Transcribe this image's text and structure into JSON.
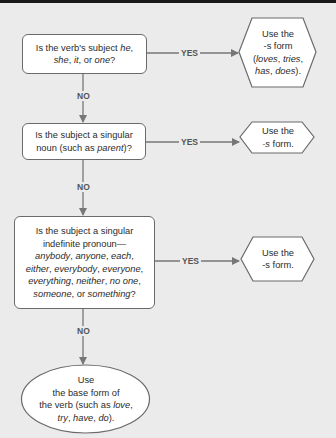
{
  "flowchart": {
    "questions": [
      {
        "id": "q1",
        "parts": [
          {
            "t": "Is the verb's subject "
          },
          {
            "t": "he",
            "i": true
          },
          {
            "t": ","
          },
          {
            "br": true
          },
          {
            "t": "she",
            "i": true
          },
          {
            "t": ", "
          },
          {
            "t": "it",
            "i": true
          },
          {
            "t": ", or "
          },
          {
            "t": "one",
            "i": true
          },
          {
            "t": "?"
          }
        ],
        "yes_label": "YES",
        "no_label": "NO"
      },
      {
        "id": "q2",
        "parts": [
          {
            "t": "Is the subject a singular"
          },
          {
            "br": true
          },
          {
            "t": "noun (such as "
          },
          {
            "t": "parent",
            "i": true
          },
          {
            "t": ")?"
          }
        ],
        "yes_label": "YES",
        "no_label": "NO"
      },
      {
        "id": "q3",
        "parts": [
          {
            "t": "Is the subject a singular"
          },
          {
            "br": true
          },
          {
            "t": "indefinite pronoun—"
          },
          {
            "br": true
          },
          {
            "t": "anybody",
            "i": true
          },
          {
            "t": ", "
          },
          {
            "t": "anyone",
            "i": true
          },
          {
            "t": ", "
          },
          {
            "t": "each",
            "i": true
          },
          {
            "t": ","
          },
          {
            "br": true
          },
          {
            "t": "either",
            "i": true
          },
          {
            "t": ", "
          },
          {
            "t": "everybody",
            "i": true
          },
          {
            "t": ", "
          },
          {
            "t": "everyone",
            "i": true
          },
          {
            "t": ","
          },
          {
            "br": true
          },
          {
            "t": "everything",
            "i": true
          },
          {
            "t": ", "
          },
          {
            "t": "neither",
            "i": true
          },
          {
            "t": ", "
          },
          {
            "t": "no one",
            "i": true
          },
          {
            "t": ","
          },
          {
            "br": true
          },
          {
            "t": "someone",
            "i": true
          },
          {
            "t": ", or "
          },
          {
            "t": "something",
            "i": true
          },
          {
            "t": "?"
          }
        ],
        "yes_label": "YES",
        "no_label": "NO"
      }
    ],
    "outcomes": [
      {
        "id": "o1",
        "parts": [
          {
            "t": "Use the"
          },
          {
            "br": true
          },
          {
            "t": "-s form"
          },
          {
            "br": true
          },
          {
            "t": "("
          },
          {
            "t": "loves",
            "i": true
          },
          {
            "t": ", "
          },
          {
            "t": "tries",
            "i": true
          },
          {
            "t": ","
          },
          {
            "br": true
          },
          {
            "t": "has",
            "i": true
          },
          {
            "t": ", "
          },
          {
            "t": "does",
            "i": true
          },
          {
            "t": ")."
          }
        ]
      },
      {
        "id": "o2",
        "parts": [
          {
            "t": "Use the"
          },
          {
            "br": true
          },
          {
            "t": "-s",
            "i": true
          },
          {
            "t": " form."
          }
        ]
      },
      {
        "id": "o3",
        "parts": [
          {
            "t": "Use the"
          },
          {
            "br": true
          },
          {
            "t": "-s form."
          }
        ]
      }
    ],
    "final": {
      "id": "final",
      "parts": [
        {
          "t": "Use"
        },
        {
          "br": true
        },
        {
          "t": "the base form of"
        },
        {
          "br": true
        },
        {
          "t": "the verb (such as "
        },
        {
          "t": "love",
          "i": true
        },
        {
          "t": ","
        },
        {
          "br": true
        },
        {
          "t": "try",
          "i": true
        },
        {
          "t": ", "
        },
        {
          "t": "have",
          "i": true
        },
        {
          "t": ", "
        },
        {
          "t": "do",
          "i": true
        },
        {
          "t": ")."
        }
      ]
    },
    "colors": {
      "background": "#ebebeb",
      "line": "#777777",
      "shape_fill": "#ffffff",
      "shape_border": "#6a6a6a",
      "top_bar": "#1a1a1a"
    }
  }
}
